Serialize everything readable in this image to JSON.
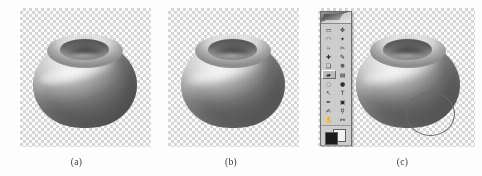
{
  "figure": {
    "panels": [
      {
        "id": "a",
        "caption": "(a)",
        "object": "shaded sphere with circular crater depression on top",
        "background": "transparency checkerboard",
        "overlay": "none"
      },
      {
        "id": "b",
        "caption": "(b)",
        "object": "shaded sphere with circular crater depression on top",
        "background": "transparency checkerboard",
        "overlay": "none"
      },
      {
        "id": "c",
        "caption": "(c)",
        "object": "shaded sphere with circular crater depression on top",
        "background": "transparency checkerboard",
        "overlay": "photoshop tool palette and elliptical selection marquee"
      }
    ]
  },
  "toolbar": {
    "title": "",
    "title_icon": "photoshop-logo-icon",
    "tools": [
      {
        "name": "marquee-tool",
        "glyph": "▭",
        "selected": false
      },
      {
        "name": "move-tool",
        "glyph": "✥",
        "selected": false
      },
      {
        "name": "lasso-tool",
        "glyph": "◠",
        "selected": false
      },
      {
        "name": "magic-wand-tool",
        "glyph": "✦",
        "selected": false
      },
      {
        "name": "crop-tool",
        "glyph": "⌗",
        "selected": false
      },
      {
        "name": "slice-tool",
        "glyph": "✂",
        "selected": false
      },
      {
        "name": "healing-brush-tool",
        "glyph": "✚",
        "selected": false
      },
      {
        "name": "brush-tool",
        "glyph": "✎",
        "selected": false
      },
      {
        "name": "clone-stamp-tool",
        "glyph": "❏",
        "selected": false
      },
      {
        "name": "history-brush-tool",
        "glyph": "❋",
        "selected": false
      },
      {
        "name": "eraser-tool",
        "glyph": "▰",
        "selected": true
      },
      {
        "name": "gradient-tool",
        "glyph": "▤",
        "selected": false
      },
      {
        "name": "blur-tool",
        "glyph": "◌",
        "selected": false
      },
      {
        "name": "dodge-tool",
        "glyph": "●",
        "selected": false
      },
      {
        "name": "path-selection-tool",
        "glyph": "↖",
        "selected": false
      },
      {
        "name": "type-tool",
        "glyph": "T",
        "selected": false
      },
      {
        "name": "pen-tool",
        "glyph": "✒",
        "selected": false
      },
      {
        "name": "shape-tool",
        "glyph": "▣",
        "selected": false
      },
      {
        "name": "notes-tool",
        "glyph": "✍",
        "selected": false
      },
      {
        "name": "eyedropper-tool",
        "glyph": "⚲",
        "selected": false
      },
      {
        "name": "hand-tool",
        "glyph": "✋",
        "selected": false
      },
      {
        "name": "zoom-tool",
        "glyph": "⚯",
        "selected": false
      }
    ],
    "colors": {
      "foreground": "#1b1b1b",
      "background": "#f5f5f5"
    },
    "mask_modes": [
      {
        "name": "standard-mode",
        "selected": true
      },
      {
        "name": "quick-mask-mode",
        "selected": false
      }
    ],
    "screen_modes": [
      {
        "name": "standard-screen-mode",
        "selected": true
      },
      {
        "name": "full-screen-with-menubar-mode",
        "selected": false
      },
      {
        "name": "full-screen-mode",
        "selected": false
      }
    ],
    "jump_to": {
      "name": "jump-to-imageready-button"
    }
  },
  "selection": {
    "name": "elliptical-selection-marquee",
    "shape": "ellipse"
  },
  "colors": {
    "page_background": "#fdfdfd",
    "checker_light": "#fefefe",
    "checker_dark": "#d8d8d8",
    "toolbar_face": "#cfcfcf",
    "toolbar_border": "#6e6e6e",
    "caption_text": "#3a3a3a",
    "marquee_stroke": "#6b6b6b"
  }
}
